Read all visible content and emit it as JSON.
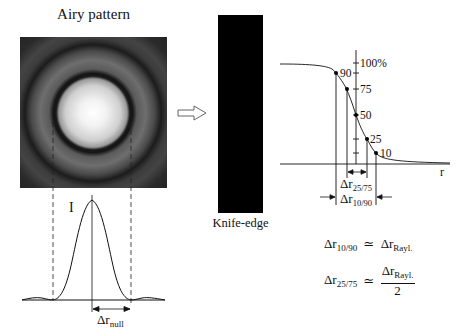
{
  "airy": {
    "title": "Airy pattern",
    "image": {
      "x": 20,
      "y": 37,
      "w": 147,
      "h": 151,
      "cx": 93,
      "cy": 113
    },
    "profile_label": "I",
    "null_label": "Δr",
    "null_sub": "null"
  },
  "transition_arrow": {
    "icon": "hollow-right-arrow-icon"
  },
  "knife_edge": {
    "label": "Knife-edge",
    "color": "#000000"
  },
  "edge_graph": {
    "axis_label_r": "r",
    "ticks": [
      {
        "label": "100%",
        "value": 100
      },
      {
        "label": "90",
        "value": 90
      },
      {
        "label": "75",
        "value": 75
      },
      {
        "label": "50",
        "value": 50
      },
      {
        "label": "25",
        "value": 25
      },
      {
        "label": "10",
        "value": 10
      }
    ],
    "dr2575_label": "Δr",
    "dr2575_sub": "25/75",
    "dr1090_label": "Δr",
    "dr1090_sub": "10/90"
  },
  "equations": {
    "eq1": {
      "lhs": "Δr",
      "lhs_sub": "10/90",
      "op": "≃",
      "rhs": "Δr",
      "rhs_sub": "Rayl."
    },
    "eq2": {
      "lhs": "Δr",
      "lhs_sub": "25/75",
      "op": "≃",
      "num": "Δr",
      "num_sub": "Rayl.",
      "den": "2"
    }
  }
}
